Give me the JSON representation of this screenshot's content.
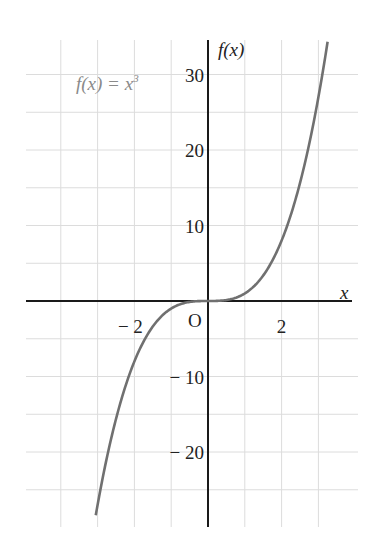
{
  "chart_data": {
    "type": "line",
    "title": "",
    "annotation": "f(x) = x³",
    "xlabel": "x",
    "ylabel": "f(x)",
    "origin_label": "O",
    "xlim": [
      -4.9,
      4
    ],
    "ylim": [
      -30,
      35
    ],
    "x_ticks": [
      {
        "value": -2,
        "label": "− 2"
      },
      {
        "value": 2,
        "label": "2"
      }
    ],
    "y_ticks": [
      {
        "value": 30,
        "label": "30"
      },
      {
        "value": 20,
        "label": "20"
      },
      {
        "value": 10,
        "label": "10"
      },
      {
        "value": -10,
        "label": "− 10"
      },
      {
        "value": -20,
        "label": "− 20"
      }
    ],
    "grid": {
      "on": true,
      "x_step": 1,
      "y_step": 5
    },
    "series": [
      {
        "name": "f(x) = x^3",
        "function": "x^3",
        "x_range": [
          -3.05,
          3.25
        ],
        "points": [
          {
            "x": -3,
            "y": -27
          },
          {
            "x": -2,
            "y": -8
          },
          {
            "x": -1,
            "y": -1
          },
          {
            "x": 0,
            "y": 0
          },
          {
            "x": 1,
            "y": 1
          },
          {
            "x": 2,
            "y": 8
          },
          {
            "x": 3,
            "y": 27
          }
        ]
      }
    ],
    "colors": {
      "curve": "#707070",
      "axis": "#1a1a1a",
      "grid": "#dcdcdc",
      "formula": "#8a8a8a"
    }
  }
}
